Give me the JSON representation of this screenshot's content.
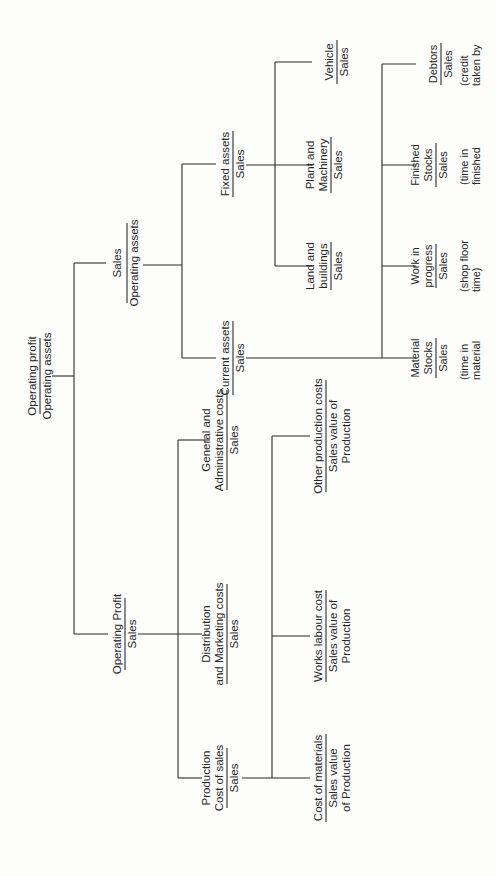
{
  "diagram": {
    "type": "ratio-pyramid-tree",
    "orientation": "rotated-90-ccw",
    "root": {
      "id": "roa",
      "numerator": "Operating profit",
      "denominator": "Operating assets"
    },
    "branches": {
      "asset_turnover": {
        "numerator": "Sales",
        "denominator": "Operating assets",
        "children": {
          "fixed_assets": {
            "numerator": "Fixed assets",
            "denominator": "Sales",
            "children": {
              "land": {
                "numerator_lines": [
                  "Land and",
                  "buildings"
                ],
                "denominator": "Sales"
              },
              "plant": {
                "numerator_lines": [
                  "Plant and",
                  "Machinery"
                ],
                "denominator": "Sales"
              },
              "vehicle": {
                "numerator_lines": [
                  "Vehicle"
                ],
                "denominator": "Sales"
              }
            }
          },
          "current_assets": {
            "numerator": "Current assets",
            "denominator": "Sales",
            "children": {
              "material": {
                "numerator_lines": [
                  "Material",
                  "Stocks"
                ],
                "denominator": "Sales",
                "note_lines": [
                  "(time in",
                  "material"
                ]
              },
              "wip": {
                "numerator_lines": [
                  "Work in",
                  "progress"
                ],
                "denominator": "Sales",
                "note_lines": [
                  "(shop floor",
                  "time)"
                ]
              },
              "finished": {
                "numerator_lines": [
                  "Finished",
                  "Stocks"
                ],
                "denominator": "Sales",
                "note_lines": [
                  "(time in",
                  "finished"
                ]
              },
              "debtors": {
                "numerator_lines": [
                  "Debtors"
                ],
                "denominator": "Sales",
                "note_lines": [
                  "(credit",
                  "taken by"
                ]
              }
            }
          }
        }
      },
      "profit_margin": {
        "numerator": "Operating Profit",
        "denominator": "Sales",
        "children": {
          "production": {
            "numerator_lines": [
              "Production",
              "Cost of sales"
            ],
            "denominator": "Sales",
            "children": {
              "materials": {
                "numerator": "Cost of materials",
                "denominator_lines": [
                  "Sales value",
                  "of Production"
                ]
              },
              "labour": {
                "numerator": "Works labour cost",
                "denominator_lines": [
                  "Sales value of",
                  "Production"
                ]
              },
              "other": {
                "numerator": "Other production costs",
                "denominator_lines": [
                  "Sales value of",
                  "Production"
                ]
              }
            }
          },
          "distribution": {
            "numerator_lines": [
              "Distribution",
              "and Marketing costs"
            ],
            "denominator": "Sales"
          },
          "general": {
            "numerator_lines": [
              "General and",
              "Administrative costs"
            ],
            "denominator": "Sales"
          }
        }
      }
    }
  },
  "colors": {
    "ink": "#262626",
    "line": "#2b2b2b",
    "paper": "#fdfdfc"
  }
}
